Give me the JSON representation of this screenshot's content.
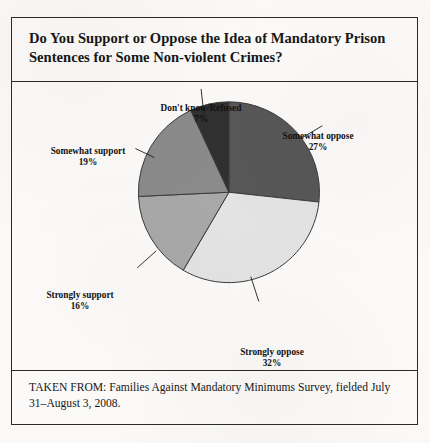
{
  "figure": {
    "title": "Do You Support or Oppose the Idea of Mandatory Prison Sentences for Some Non-violent Crimes?",
    "source_note": "TAKEN FROM: Families Against Mandatory Minimums Survey, fielded July 31–August 3, 2008."
  },
  "labels": {
    "dont_know": {
      "name": "Don't know/Refused",
      "pct": "7%"
    },
    "somewhat_oppose": {
      "name": "Somewhat oppose",
      "pct": "27%"
    },
    "somewhat_support": {
      "name": "Somewhat support",
      "pct": "19%"
    },
    "strongly_support": {
      "name": "Strongly support",
      "pct": "16%"
    },
    "strongly_oppose": {
      "name": "Strongly oppose",
      "pct": "32%"
    }
  },
  "colors": {
    "dont_know": "#303030",
    "somewhat_oppose": "#575757",
    "somewhat_support": "#8a8a8a",
    "strongly_support": "#a8a8a8",
    "strongly_oppose": "#e3e3e3",
    "outline": "#3a3a3a",
    "frame": "#2b2b2b",
    "page": "#faf9f7",
    "text": "#171717"
  },
  "chart_data": {
    "type": "pie",
    "title": "Do You Support or Oppose the Idea of Mandatory Prison Sentences for Some Non-violent Crimes?",
    "xlabel": "",
    "ylabel": "",
    "grid": false,
    "legend": "callout-labels",
    "units": "percent",
    "total": 101,
    "start_angle_deg": 0,
    "direction": "clockwise",
    "categories": [
      "Somewhat oppose",
      "Strongly oppose",
      "Strongly support",
      "Somewhat support",
      "Don't know/Refused"
    ],
    "values": [
      27,
      32,
      16,
      19,
      7
    ],
    "slice_colors": [
      "#575757",
      "#e3e3e3",
      "#a8a8a8",
      "#8a8a8a",
      "#303030"
    ],
    "slices": [
      {
        "label": "Somewhat oppose",
        "value": 27,
        "display": "27%",
        "color": "#575757"
      },
      {
        "label": "Strongly oppose",
        "value": 32,
        "display": "32%",
        "color": "#e3e3e3"
      },
      {
        "label": "Strongly support",
        "value": 16,
        "display": "16%",
        "color": "#a8a8a8"
      },
      {
        "label": "Somewhat support",
        "value": 19,
        "display": "19%",
        "color": "#8a8a8a"
      },
      {
        "label": "Don't know/Refused",
        "value": 7,
        "display": "7%",
        "color": "#303030"
      }
    ]
  }
}
